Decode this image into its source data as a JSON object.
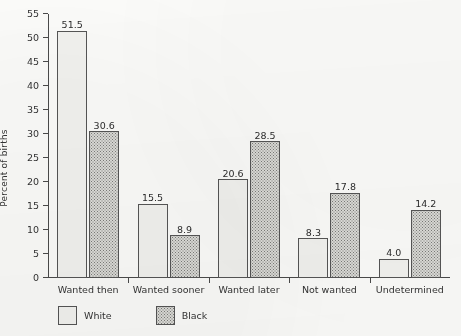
{
  "chart_data": {
    "type": "bar",
    "title": "",
    "subtitle": "",
    "xlabel": "",
    "ylabel": "Percent of births",
    "categories": [
      "Wanted then",
      "Wanted sooner",
      "Wanted later",
      "Not wanted",
      "Undetermined"
    ],
    "series": [
      {
        "name": "White",
        "values": [
          51.5,
          15.5,
          20.6,
          8.3,
          4.0
        ],
        "fill": "solid-light",
        "color": "#f2f2ef"
      },
      {
        "name": "Black",
        "values": [
          30.6,
          8.9,
          28.5,
          17.8,
          14.2
        ],
        "fill": "stippled",
        "color": "#dcdcd8"
      }
    ],
    "value_labels": [
      "51.5",
      "30.6",
      "15.5",
      "8.9",
      "20.6",
      "28.5",
      "8.3",
      "17.8",
      "4.0",
      "14.2"
    ],
    "ylim": [
      0,
      55
    ],
    "ytick_step": 5,
    "yticks": [
      0,
      5,
      10,
      15,
      20,
      25,
      30,
      35,
      40,
      45,
      50,
      55
    ],
    "ytick_labels": [
      "0",
      "5",
      "10",
      "15",
      "20",
      "25",
      "30",
      "35",
      "40",
      "45",
      "50",
      "55"
    ],
    "grid": false,
    "legend_position": "bottom-left",
    "legend": [
      {
        "label": "White",
        "swatch": "white-swatch"
      },
      {
        "label": "Black",
        "swatch": "black-stippled-swatch"
      }
    ]
  },
  "axis": {
    "y_title": "Percent of births"
  }
}
